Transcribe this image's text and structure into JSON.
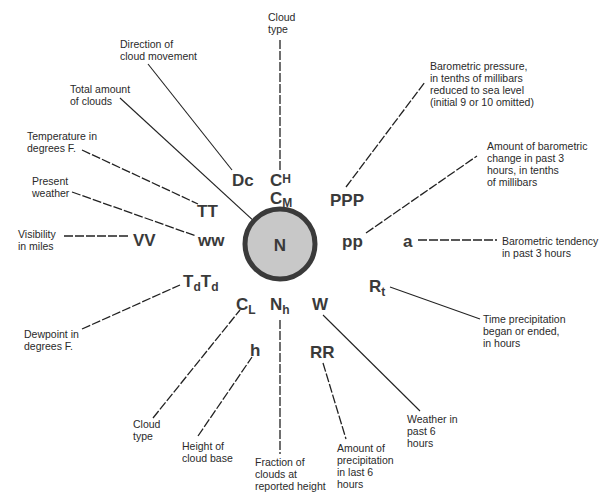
{
  "colors": {
    "circle_fill": "#c8c8c8",
    "circle_stroke": "#3a3a3a",
    "symbol": "#3a3a3a",
    "text": "#2a2a2a",
    "line": "#222222"
  },
  "center": {
    "symbol": "N"
  },
  "symbols": {
    "dc": "Dc",
    "ch_base": "C",
    "ch_sub": "H",
    "cm_base": "C",
    "cm_sub": "M",
    "ppp": "PPP",
    "pp": "pp",
    "a": "a",
    "tt": "TT",
    "ww": "ww",
    "vv": "VV",
    "td_base": "T",
    "td_sub": "d",
    "cl_base": "C",
    "cl_sub": "L",
    "nh_base": "N",
    "nh_sub": "h",
    "w": "W",
    "rt_base": "R",
    "rt_sub": "t",
    "h": "h",
    "rr": "RR"
  },
  "labels": {
    "cloud_type_high": [
      "Cloud",
      "type"
    ],
    "direction_cloud": [
      "Direction of",
      "cloud movement"
    ],
    "total_clouds": [
      "Total amount",
      "of clouds"
    ],
    "temperature": [
      "Temperature in",
      "degrees F."
    ],
    "present_weather": [
      "Present",
      "weather"
    ],
    "visibility": [
      "Visibility",
      "in miles"
    ],
    "pressure": [
      "Barometric pressure,",
      "in tenths of millibars",
      "reduced to sea level",
      "(initial 9 or 10 omitted)"
    ],
    "pressure_change": [
      "Amount of barometric",
      "change in past 3",
      "hours, in tenths",
      "of millibars"
    ],
    "tendency": [
      "Barometric tendency",
      "in past 3 hours"
    ],
    "precip_time": [
      "Time precipitation",
      "began or ended,",
      "in hours"
    ],
    "dewpoint": [
      "Dewpoint in",
      "degrees F."
    ],
    "cloud_type_low": [
      "Cloud",
      "type"
    ],
    "cloud_base": [
      "Height  of",
      "cloud base"
    ],
    "fraction_clouds": [
      "Fraction of",
      "clouds at",
      "reported height"
    ],
    "precip_amount": [
      "Amount of",
      "precipitation",
      "in last 6",
      "hours"
    ],
    "past_weather": [
      "Weather in",
      "past 6",
      "hours"
    ]
  }
}
